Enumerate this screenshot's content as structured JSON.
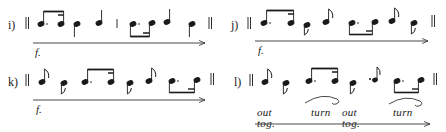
{
  "figure": {
    "examples": [
      {
        "id": "i",
        "label": "i)",
        "dynamic": "f.",
        "arrow": "crescendo-arrow",
        "rhythm": [
          "dotted-eighth+sixteenth (beamed)",
          "quarter (stem down)",
          "quarter (stem up)",
          "|",
          "dotted-eighth+sixteenth (beamed below)",
          "quarter (stem up)",
          "quarter (stem down)"
        ]
      },
      {
        "id": "j",
        "label": "j)",
        "dynamic": "f.",
        "arrow": "crescendo-arrow",
        "rhythm": [
          "dotted-eighth+sixteenth (beamed)",
          "eighth (stem down)",
          "eighth (flag up)",
          "dotted-eighth+sixteenth (beamed below)",
          "eighth (flag up)",
          "eighth (stem down)"
        ]
      },
      {
        "id": "k",
        "label": "k)",
        "dynamic": "f.",
        "arrow": "crescendo-arrow",
        "rhythm": [
          "eighth (flag up)",
          "eighth (stem down)",
          "dotted-eighth+sixteenth (beamed)",
          "eighth (stem down)",
          "eighth (flag up)",
          "dotted-eighth+sixteenth (beamed below)"
        ]
      },
      {
        "id": "l",
        "label": "l)",
        "arrow": "crescendo-arrow",
        "rhythm": [
          "eighth (flag up)",
          "eighth (stem down)",
          "dotted-eighth+sixteenth (beamed)",
          "eighth (stem down)",
          "eighth (flag up, staccato)",
          "dotted-eighth+sixteenth (beamed below)"
        ],
        "annotations": [
          "out tog.",
          "turn",
          "out tog.",
          "turn"
        ]
      }
    ],
    "barline_symbol": "‖"
  }
}
